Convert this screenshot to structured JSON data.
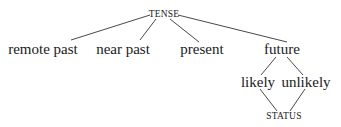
{
  "diagram": {
    "type": "tree",
    "root": {
      "id": "tense",
      "label": "TENSE"
    },
    "nodes": [
      {
        "id": "tense",
        "label": "TENSE",
        "x": 164,
        "y": 15,
        "style": "small-caps"
      },
      {
        "id": "remote_past",
        "label": "remote past",
        "x": 43,
        "y": 49
      },
      {
        "id": "near_past",
        "label": "near past",
        "x": 123,
        "y": 49
      },
      {
        "id": "present",
        "label": "present",
        "x": 202,
        "y": 49
      },
      {
        "id": "future",
        "label": "future",
        "x": 282,
        "y": 49
      },
      {
        "id": "likely",
        "label": "likely",
        "x": 258,
        "y": 82
      },
      {
        "id": "unlikely",
        "label": "unlikely",
        "x": 306,
        "y": 82
      },
      {
        "id": "status",
        "label": "STATUS",
        "x": 284,
        "y": 117,
        "style": "small-caps"
      }
    ],
    "edges": [
      {
        "from": "tense",
        "to": "remote_past"
      },
      {
        "from": "tense",
        "to": "near_past"
      },
      {
        "from": "tense",
        "to": "present"
      },
      {
        "from": "tense",
        "to": "future"
      },
      {
        "from": "future",
        "to": "likely"
      },
      {
        "from": "future",
        "to": "unlikely"
      },
      {
        "from": "likely",
        "to": "status"
      },
      {
        "from": "unlikely",
        "to": "status"
      }
    ],
    "labels": {
      "tense": "TENSE",
      "remote_past": "remote past",
      "near_past": "near past",
      "present": "present",
      "future": "future",
      "likely": "likely",
      "unlikely": "unlikely",
      "status": "STATUS"
    },
    "line_color": "#333333",
    "text_color": "#1a1a1a"
  }
}
